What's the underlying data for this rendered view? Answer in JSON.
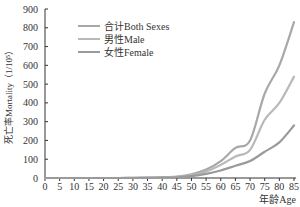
{
  "chart_data": {
    "type": "line",
    "title": "",
    "xlabel": "年龄Age",
    "ylabel": "死亡率Mortality（1/10⁵）",
    "x": [
      0,
      5,
      10,
      15,
      20,
      25,
      30,
      35,
      40,
      45,
      50,
      55,
      60,
      65,
      70,
      75,
      80,
      85
    ],
    "xticks": [
      "0",
      "5",
      "10",
      "15",
      "20",
      "25",
      "30",
      "35",
      "40",
      "45",
      "50",
      "55",
      "60",
      "65",
      "70",
      "75",
      "80",
      "85"
    ],
    "yticks": [
      "0",
      "100",
      "200",
      "300",
      "400",
      "500",
      "600",
      "700",
      "800",
      "900"
    ],
    "ylim": [
      0,
      900
    ],
    "xlim": [
      0,
      85
    ],
    "grid": false,
    "legend_position": "upper-left",
    "series": [
      {
        "name": "合计Both Sexes",
        "color": "#a8a8a8",
        "values": [
          0,
          0,
          0,
          0,
          0,
          0,
          1,
          2,
          4,
          8,
          20,
          45,
          90,
          160,
          200,
          450,
          600,
          830
        ]
      },
      {
        "name": "男性Male",
        "color": "#b8b8b8",
        "values": [
          0,
          0,
          0,
          0,
          0,
          0,
          1,
          2,
          3,
          6,
          15,
          35,
          70,
          115,
          150,
          310,
          400,
          540
        ]
      },
      {
        "name": "女性Female",
        "color": "#9a9a9a",
        "values": [
          0,
          0,
          0,
          0,
          0,
          0,
          0,
          1,
          2,
          4,
          10,
          22,
          40,
          65,
          90,
          140,
          190,
          280
        ]
      }
    ]
  }
}
